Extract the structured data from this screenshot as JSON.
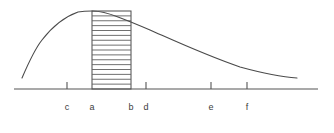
{
  "figure": {
    "title": "",
    "background_color": "#ffffff",
    "curve_color": "#4a4a4a",
    "axis_color": "#555555",
    "hatch_color": "#606060",
    "label_color": "#3c3c3c",
    "tick_labels": [
      "c",
      "a",
      "b",
      "d",
      "e",
      "f"
    ],
    "hatch_line_count": 15
  },
  "chart_data": {
    "type": "line",
    "title": "",
    "xlabel": "",
    "ylabel": "",
    "grid": false,
    "legend": null,
    "axis": {
      "x_start_px": 14,
      "x_end_px": 318,
      "baseline_y_px": 89,
      "xlim": [
        14,
        318
      ],
      "ylim": [
        0,
        89
      ]
    },
    "ticks": [
      {
        "label": "c",
        "x_px": 67
      },
      {
        "label": "a",
        "x_px": 92
      },
      {
        "label": "b",
        "x_px": 131
      },
      {
        "label": "d",
        "x_px": 146
      },
      {
        "label": "e",
        "x_px": 211
      },
      {
        "label": "f",
        "x_px": 247
      }
    ],
    "tick_label_y_px": 110,
    "tick_mark_height_px": 7,
    "curve": {
      "name": "density-curve",
      "description": "unimodal hump rising steeply on the left, peaking near a, falling gradually to the right",
      "x": [
        22,
        30,
        40,
        50,
        60,
        70,
        80,
        92,
        105,
        120,
        131,
        150,
        175,
        200,
        225,
        250,
        275,
        297
      ],
      "y": [
        78,
        60,
        44,
        34,
        25,
        19,
        14,
        11,
        12,
        15,
        19,
        26,
        35,
        43,
        51,
        59,
        68,
        78
      ],
      "path_d": "M22,78 C28,64 34,50 42,40 C52,27 64,17 78,12 C84,11 88,11 92,11 C100,11 108,13 118,17 C126,20 136,24 150,30 C175,41 205,55 240,67 C262,73 282,77 297,78"
    },
    "shaded_region": {
      "name": "hatched-rectangle",
      "from_tick": "a",
      "to_tick": "b",
      "x0_px": 92,
      "x1_px": 131,
      "top_y_px": 11,
      "bottom_y_px": 89,
      "fill": "horizontal-hatch",
      "hatch_lines": 15
    }
  }
}
